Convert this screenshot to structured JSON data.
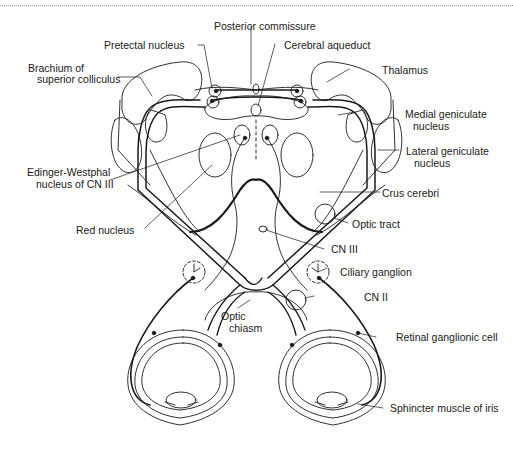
{
  "figure": {
    "colors": {
      "line": "#1a1a1a",
      "background": "#ffffff",
      "frame": "#9a9a9a"
    }
  },
  "labels": {
    "posterior_commissure": "Posterior commissure",
    "pretectal_nucleus": "Pretectal nucleus",
    "cerebral_aqueduct": "Cerebral aqueduct",
    "brachium_line1": "Brachium of",
    "brachium_line2": "superior colliculus",
    "thalamus": "Thalamus",
    "medial_geniculate_line1": "Medial geniculate",
    "medial_geniculate_line2": "nucleus",
    "lateral_geniculate_line1": "Lateral geniculate",
    "lateral_geniculate_line2": "nucleus",
    "edinger_line1": "Edinger-Westphal",
    "edinger_line2": "nucleus of CN III",
    "crus_cerebri": "Crus cerebri",
    "red_nucleus": "Red nucleus",
    "optic_tract": "Optic tract",
    "cn_iii": "CN III",
    "ciliary_ganglion": "Ciliary ganglion",
    "cn_ii": "CN II",
    "optic_chiasm_line1": "Optic",
    "optic_chiasm_line2": "chiasm",
    "retinal_ganglionic_cell": "Retinal ganglionic cell",
    "sphincter_muscle": "Sphincter muscle of iris"
  }
}
